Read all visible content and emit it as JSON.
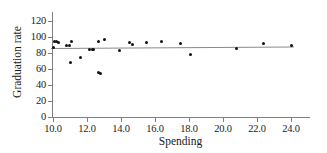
{
  "figure": {
    "width": 327,
    "height": 153,
    "background": "#ffffff",
    "marker_color": "#111111",
    "line_color": "#8a8a8a",
    "axis_color": "#808080"
  },
  "chart_data": {
    "type": "scatter",
    "title": "",
    "xlabel": "Spending",
    "ylabel": "Graduation rate",
    "xlim": [
      9.6,
      24.8
    ],
    "ylim": [
      0,
      120
    ],
    "xticks": [
      10.0,
      12.0,
      14.0,
      16.0,
      18.0,
      20.0,
      22.0,
      24.0
    ],
    "xticklabels": [
      "10.0",
      "12.0",
      "14.0",
      "16.0",
      "18.0",
      "20.0",
      "22.0",
      "24.0"
    ],
    "yticks": [
      0,
      20,
      40,
      60,
      80,
      100,
      120
    ],
    "yticklabels": [
      "0",
      "20",
      "40",
      "60",
      "80",
      "100",
      "120"
    ],
    "grid": false,
    "legend": null,
    "points": [
      {
        "x": 10.0,
        "y": 87
      },
      {
        "x": 10.1,
        "y": 94
      },
      {
        "x": 10.2,
        "y": 95
      },
      {
        "x": 10.3,
        "y": 93
      },
      {
        "x": 10.8,
        "y": 89
      },
      {
        "x": 10.95,
        "y": 89
      },
      {
        "x": 11.0,
        "y": 68
      },
      {
        "x": 11.1,
        "y": 95
      },
      {
        "x": 11.6,
        "y": 75
      },
      {
        "x": 12.15,
        "y": 84
      },
      {
        "x": 12.3,
        "y": 84
      },
      {
        "x": 12.4,
        "y": 84
      },
      {
        "x": 12.65,
        "y": 56
      },
      {
        "x": 12.7,
        "y": 94
      },
      {
        "x": 12.8,
        "y": 55
      },
      {
        "x": 13.0,
        "y": 97
      },
      {
        "x": 13.9,
        "y": 83
      },
      {
        "x": 14.5,
        "y": 93
      },
      {
        "x": 14.7,
        "y": 91
      },
      {
        "x": 15.5,
        "y": 93
      },
      {
        "x": 16.4,
        "y": 95
      },
      {
        "x": 17.5,
        "y": 92
      },
      {
        "x": 18.1,
        "y": 78
      },
      {
        "x": 20.8,
        "y": 86
      },
      {
        "x": 22.4,
        "y": 92
      },
      {
        "x": 24.0,
        "y": 89
      }
    ],
    "trendline": {
      "kind": "linear-fit",
      "x_start": 9.9,
      "y_start": 86.0,
      "x_end": 24.2,
      "y_end": 88.0
    }
  }
}
